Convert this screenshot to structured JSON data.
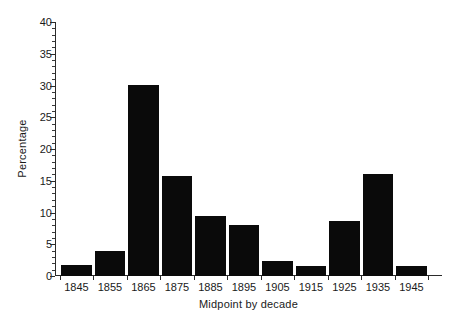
{
  "chart_data": {
    "type": "bar",
    "title": "",
    "xlabel": "Midpoint by decade",
    "ylabel": "Percentage",
    "categories": [
      "1845",
      "1855",
      "1865",
      "1875",
      "1885",
      "1895",
      "1905",
      "1915",
      "1925",
      "1935",
      "1945"
    ],
    "values": [
      1.7,
      4.0,
      30.1,
      15.8,
      9.4,
      8.0,
      2.4,
      1.5,
      8.6,
      16.0,
      1.6
    ],
    "ylim": [
      0,
      40
    ],
    "y_ticks": [
      0,
      5,
      10,
      15,
      20,
      25,
      30,
      35,
      40
    ],
    "y_tick_labels": [
      "0",
      "5",
      "10",
      "15",
      "20",
      "25",
      "30",
      "35",
      "40"
    ],
    "y_minor_tick_step": 1,
    "grid": false,
    "legend": null,
    "bar_color": "#0a0a0a",
    "background_color": "#ffffff",
    "axis_color": "#2b2b2b"
  }
}
